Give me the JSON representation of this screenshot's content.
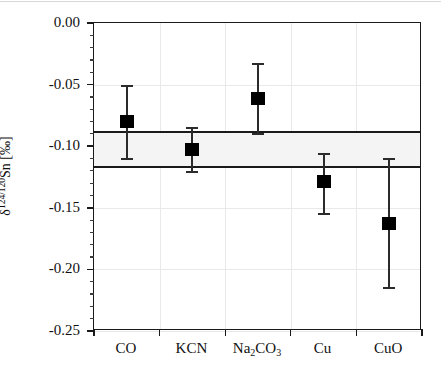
{
  "chart_data": {
    "type": "scatter",
    "title": "",
    "xlabel": "",
    "ylabel": "δ124/120Sn [‰]",
    "ylabel_parts": {
      "delta": "δ",
      "superscript": "124/120",
      "element": "Sn",
      "unit": "[‰]"
    },
    "categories": [
      "CO",
      "KCN",
      "Na2CO3",
      "Cu",
      "CuO"
    ],
    "category_labels_display": [
      "CO",
      "KCN",
      "Na",
      "CO",
      "Cu",
      "CuO"
    ],
    "values": [
      -0.08,
      -0.103,
      -0.061,
      -0.129,
      -0.163
    ],
    "err_upper": [
      0.029,
      0.018,
      0.028,
      0.023,
      0.053
    ],
    "err_lower": [
      0.03,
      0.018,
      0.029,
      0.026,
      0.052
    ],
    "points": [
      {
        "category": "CO",
        "value": -0.08,
        "upper": -0.051,
        "lower": -0.11
      },
      {
        "category": "KCN",
        "value": -0.103,
        "upper": -0.085,
        "lower": -0.121
      },
      {
        "category": "Na2CO3",
        "value": -0.061,
        "upper": -0.033,
        "lower": -0.09
      },
      {
        "category": "Cu",
        "value": -0.129,
        "upper": -0.106,
        "lower": -0.155
      },
      {
        "category": "CuO",
        "value": -0.163,
        "upper": -0.11,
        "lower": -0.215
      }
    ],
    "reference_band": {
      "label": "mean band",
      "upper": -0.088,
      "lower": -0.118,
      "mean": -0.103,
      "fill_color": "#f4f4f4",
      "edge_color": "#1a1a1a"
    },
    "ylim": [
      -0.25,
      0.0
    ],
    "ytick_labels": [
      "0.00",
      "-0.05",
      "-0.10",
      "-0.15",
      "-0.20",
      "-0.25"
    ],
    "ytick_values": [
      0.0,
      -0.05,
      -0.1,
      -0.15,
      -0.2,
      -0.25
    ],
    "yminor_step": 0.01,
    "grid": true,
    "legend": "none",
    "marker_color": "#000000",
    "marker_shape": "square"
  }
}
